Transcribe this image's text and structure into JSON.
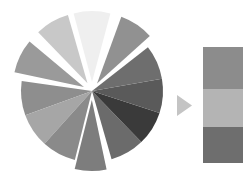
{
  "figure": {
    "background": "#ffffff",
    "width": 250,
    "height": 186
  },
  "chart_data": {
    "type": "pie",
    "title": "",
    "subtitle": "",
    "xlabel": "",
    "ylabel": "",
    "grid": false,
    "legend_position": "right",
    "start_angle_deg": 90,
    "direction": "clockwise",
    "center": {
      "x": 92,
      "y": 91
    },
    "radius": 71,
    "explode_offset": 9,
    "slice_gap_deg": 3,
    "categories": [
      "Slice 1",
      "Slice 2",
      "Slice 3",
      "Slice 4",
      "Slice 5",
      "Slice 6",
      "Slice 7",
      "Slice 8",
      "Slice 9",
      "Slice 10",
      "Slice 11",
      "Slice 12"
    ],
    "values": [
      8.33,
      8.33,
      8.33,
      8.33,
      8.33,
      8.33,
      8.33,
      8.33,
      8.33,
      8.33,
      8.33,
      8.33
    ],
    "colors": [
      "#efefef",
      "#9a9a9a",
      "#8e8e8e",
      "#c8c8c8",
      "#757575",
      "#3a3a3a",
      "#5f5f5f",
      "#6e6e6e",
      "#848484",
      "#949494",
      "#b2b2b2",
      "#d6d6d6"
    ],
    "exploded": [
      true,
      true,
      true,
      true,
      false,
      false,
      false,
      true,
      false,
      false,
      false,
      true
    ],
    "slices": [
      {
        "label": "Slice 1",
        "value": 8.33,
        "color": "#efefef",
        "start_deg": 75,
        "end_deg": 105,
        "exploded": true,
        "explode_dir_deg": 90
      },
      {
        "label": "Slice 2",
        "value": 8.33,
        "color": "#c8c8c8",
        "start_deg": 106,
        "end_deg": 134,
        "exploded": true,
        "explode_dir_deg": 120
      },
      {
        "label": "Slice 3",
        "value": 8.33,
        "color": "#9a9a9a",
        "start_deg": 140,
        "end_deg": 168,
        "exploded": true,
        "explode_dir_deg": 154
      },
      {
        "label": "Slice 4",
        "value": 8.33,
        "color": "#8e8e8e",
        "start_deg": 172,
        "end_deg": 200,
        "exploded": false,
        "explode_dir_deg": 186
      },
      {
        "label": "Slice 5",
        "value": 8.33,
        "color": "#a6a6a6",
        "start_deg": 200,
        "end_deg": 228,
        "exploded": false,
        "explode_dir_deg": 214
      },
      {
        "label": "Slice 6",
        "value": 8.33,
        "color": "#8a8a8a",
        "start_deg": 228,
        "end_deg": 256,
        "exploded": false,
        "explode_dir_deg": 242
      },
      {
        "label": "Slice 7",
        "value": 8.33,
        "color": "#7d7d7d",
        "start_deg": 256,
        "end_deg": 282,
        "exploded": true,
        "explode_dir_deg": 269
      },
      {
        "label": "Slice 8",
        "value": 8.33,
        "color": "#6b6b6b",
        "start_deg": 286,
        "end_deg": 314,
        "exploded": false,
        "explode_dir_deg": 300
      },
      {
        "label": "Slice 9",
        "value": 8.33,
        "color": "#3a3a3a",
        "start_deg": 314,
        "end_deg": 342,
        "exploded": false,
        "explode_dir_deg": 328
      },
      {
        "label": "Slice 10",
        "value": 8.33,
        "color": "#5a5a5a",
        "start_deg": 342,
        "end_deg": 370,
        "exploded": false,
        "explode_dir_deg": 356
      },
      {
        "label": "Slice 11",
        "value": 8.33,
        "color": "#6e6e6e",
        "start_deg": 370,
        "end_deg": 398,
        "exploded": false,
        "explode_dir_deg": 384
      },
      {
        "label": "Slice 12",
        "value": 8.33,
        "color": "#919191",
        "start_deg": 402,
        "end_deg": 430,
        "exploded": true,
        "explode_dir_deg": 416
      }
    ]
  },
  "arrow": {
    "name": "play-triangle",
    "color": "#c4c4c4",
    "x": 177,
    "y": 95,
    "width": 15,
    "height": 21,
    "direction": "right"
  },
  "swatch": {
    "x": 203,
    "y": 47,
    "width": 40,
    "height": 116,
    "border_color": "#ffffff",
    "bands": [
      {
        "label": "Band 1",
        "color": "#8c8c8c",
        "height_px": 42
      },
      {
        "label": "Band 2",
        "color": "#b4b4b4",
        "height_px": 38
      },
      {
        "label": "Band 3",
        "color": "#6e6e6e",
        "height_px": 36
      }
    ]
  }
}
